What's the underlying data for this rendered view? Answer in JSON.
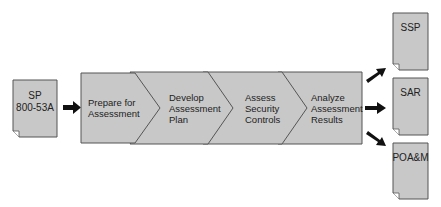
{
  "diagram": {
    "input_document": {
      "lines": [
        "SP",
        "800-53A"
      ]
    },
    "steps": [
      {
        "lines": [
          "Prepare for",
          "Assessment"
        ]
      },
      {
        "lines": [
          "Develop",
          "Assessment",
          "Plan"
        ]
      },
      {
        "lines": [
          "Assess",
          "Security",
          "Controls"
        ]
      },
      {
        "lines": [
          "Analyze",
          "Assessment",
          "Results"
        ]
      }
    ],
    "output_documents": [
      {
        "label": "SSP"
      },
      {
        "label": "SAR"
      },
      {
        "label": "POA&M"
      }
    ],
    "colors": {
      "shape_fill": "#c8c8c8",
      "shape_stroke": "#555555",
      "arrow": "#111111",
      "text": "#222222"
    }
  }
}
